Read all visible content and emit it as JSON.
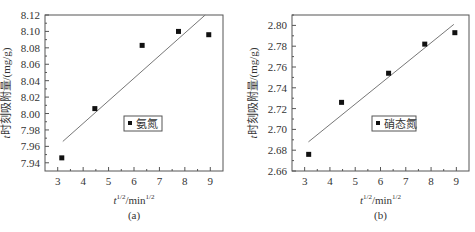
{
  "chart_data": [
    {
      "type": "scatter",
      "panel_label": "(a)",
      "title": "",
      "xlabel": "t^1/2/min^1/2",
      "xlabel_parts": {
        "t": "t",
        "t_sup": "1/2",
        "unit": "/min",
        "unit_sup": "1/2"
      },
      "ylabel": "t时刻吸附量/(mg/g)",
      "xlim": [
        2.5,
        9.5
      ],
      "ylim": [
        7.93,
        8.12
      ],
      "xticks": [
        3,
        4,
        5,
        6,
        7,
        8,
        9
      ],
      "yticks": [
        "7.94",
        "7.96",
        "7.98",
        "8.00",
        "8.02",
        "8.04",
        "8.06",
        "8.08",
        "8.10",
        "8.12"
      ],
      "grid": false,
      "legend": {
        "entries": [
          "氨氮"
        ],
        "position": "center-right"
      },
      "series": [
        {
          "name": "氨氮",
          "marker": "square",
          "x": [
            3.16,
            4.46,
            6.32,
            7.75,
            8.94
          ],
          "y": [
            7.946,
            8.006,
            8.083,
            8.1,
            8.096
          ]
        }
      ],
      "fit_line": {
        "x": [
          3.2,
          8.8
        ],
        "y": [
          7.966,
          8.12
        ]
      }
    },
    {
      "type": "scatter",
      "panel_label": "(b)",
      "title": "",
      "xlabel": "t^1/2/min^1/2",
      "xlabel_parts": {
        "t": "t",
        "t_sup": "1/2",
        "unit": "/min",
        "unit_sup": "1/2"
      },
      "ylabel": "t时刻吸附量/(mg/g)",
      "xlim": [
        2.5,
        9.5
      ],
      "ylim": [
        2.66,
        2.81
      ],
      "xticks": [
        3,
        4,
        5,
        6,
        7,
        8,
        9
      ],
      "yticks": [
        "2.66",
        "2.68",
        "2.70",
        "2.72",
        "2.74",
        "2.76",
        "2.78",
        "2.80"
      ],
      "grid": false,
      "legend": {
        "entries": [
          "硝态氮"
        ],
        "position": "center-right"
      },
      "series": [
        {
          "name": "硝态氮",
          "marker": "square",
          "x": [
            3.16,
            4.46,
            6.32,
            7.75,
            8.94
          ],
          "y": [
            2.676,
            2.726,
            2.754,
            2.782,
            2.793
          ]
        }
      ],
      "fit_line": {
        "x": [
          3.15,
          8.9
        ],
        "y": [
          2.688,
          2.801
        ]
      }
    }
  ],
  "colors": {
    "frame": "#555555",
    "marker": "#111111",
    "fit_line": "#777777",
    "text": "#333333"
  }
}
